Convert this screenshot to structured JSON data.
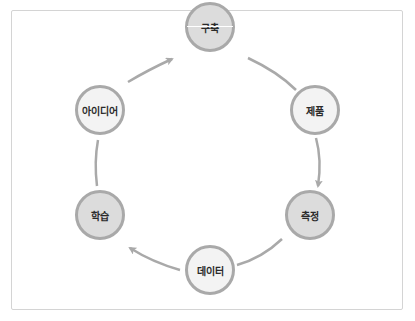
{
  "diagram": {
    "type": "cycle",
    "nodes": [
      {
        "id": "build",
        "label": "구축",
        "style": "dark"
      },
      {
        "id": "product",
        "label": "제품",
        "style": "light"
      },
      {
        "id": "measure",
        "label": "측정",
        "style": "dark"
      },
      {
        "id": "data",
        "label": "데이터",
        "style": "light"
      },
      {
        "id": "learn",
        "label": "학습",
        "style": "dark"
      },
      {
        "id": "idea",
        "label": "아이디어",
        "style": "light"
      }
    ],
    "edges": [
      {
        "from": "build",
        "to": "product"
      },
      {
        "from": "product",
        "to": "measure",
        "arrow": true
      },
      {
        "from": "measure",
        "to": "data"
      },
      {
        "from": "data",
        "to": "learn",
        "arrow": true
      },
      {
        "from": "learn",
        "to": "idea"
      },
      {
        "from": "idea",
        "to": "build",
        "arrow": true
      }
    ],
    "colors": {
      "border": "#a9a9a9",
      "dark_fill": "#dcdcdc",
      "light_fill": "#f3f3f3",
      "frame": "#d4d4d4"
    }
  }
}
